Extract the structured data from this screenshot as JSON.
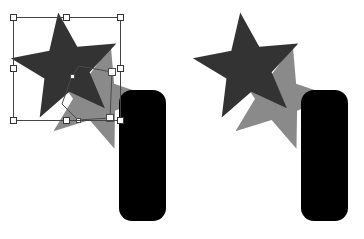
{
  "canvas": {
    "width": 364,
    "height": 239,
    "background_color": "#ffffff",
    "description": "Vector editor artwork comparison: selected star with transform handles and path overlay (left) versus deselected result (right)"
  },
  "colors": {
    "background": "#ffffff",
    "star_fill": "#333333",
    "shadow_shape_fill": "#8a8a8a",
    "rounded_rect_fill": "#000000",
    "selection_stroke": "#444444",
    "handle_fill": "#ffffff",
    "handle_stroke": "#333333",
    "path_stroke": "#4a4a4a",
    "path_anchor_fill": "#ffffff"
  },
  "panels": [
    {
      "id": "left",
      "name": "selected-state",
      "label": "Selected",
      "selection_visible": true,
      "path_overlay_visible": true
    },
    {
      "id": "right",
      "name": "deselected-state",
      "label": "Result",
      "selection_visible": false,
      "path_overlay_visible": false
    }
  ],
  "shapes": {
    "star": {
      "name": "five-point-star",
      "fill": "#333333",
      "points": 5,
      "center_x": 66,
      "center_y": 68,
      "outer_radius": 56,
      "inner_radius": 24,
      "rotation_deg": -8
    },
    "shadow_star": {
      "name": "offset-shadow-star",
      "fill": "#8a8a8a",
      "points": 5,
      "center_x": 96,
      "center_y": 98,
      "outer_radius": 54,
      "inner_radius": 23,
      "rotation_deg": 16
    },
    "rounded_rect": {
      "name": "rounded-rectangle",
      "fill": "#000000",
      "x": 119,
      "y": 90,
      "width": 47,
      "height": 131,
      "corner_radius": 13
    }
  },
  "selection": {
    "name": "transform-bounding-box",
    "box": {
      "x": 13,
      "y": 17,
      "width": 107,
      "height": 103
    },
    "stroke": "#444444",
    "stroke_width": 1,
    "handle_size": 6,
    "handle_count": 8,
    "handles": [
      {
        "name": "handle-top-left",
        "x": 13,
        "y": 17,
        "cursor": "nwse-resize"
      },
      {
        "name": "handle-top-center",
        "x": 66,
        "y": 17,
        "cursor": "ns-resize"
      },
      {
        "name": "handle-top-right",
        "x": 120,
        "y": 17,
        "cursor": "nesw-resize"
      },
      {
        "name": "handle-middle-left",
        "x": 13,
        "y": 68,
        "cursor": "ew-resize"
      },
      {
        "name": "handle-middle-right",
        "x": 120,
        "y": 68,
        "cursor": "ew-resize"
      },
      {
        "name": "handle-bottom-left",
        "x": 13,
        "y": 120,
        "cursor": "nesw-resize"
      },
      {
        "name": "handle-bottom-center",
        "x": 66,
        "y": 120,
        "cursor": "ns-resize"
      },
      {
        "name": "handle-bottom-right",
        "x": 120,
        "y": 120,
        "cursor": "nwse-resize"
      }
    ]
  },
  "path_overlay": {
    "name": "vector-path-outline",
    "stroke": "#4a4a4a",
    "stroke_width": 1,
    "polyline": "72,76 79,66 112,72 110,118 78,120 62,104 72,76",
    "anchors": [
      {
        "name": "path-anchor-1",
        "x": 72,
        "y": 76,
        "filled": false
      },
      {
        "name": "path-anchor-2",
        "x": 112,
        "y": 72,
        "filled": true
      },
      {
        "name": "path-anchor-3",
        "x": 110,
        "y": 118,
        "filled": true
      },
      {
        "name": "path-anchor-4",
        "x": 78,
        "y": 120,
        "filled": false
      }
    ]
  }
}
